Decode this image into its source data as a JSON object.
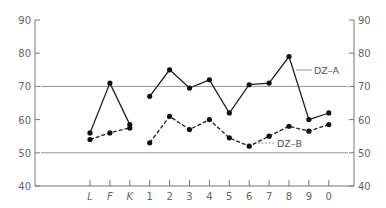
{
  "chart_data": {
    "type": "line",
    "title": "",
    "xlabel": "",
    "ylabel": "",
    "ylim": [
      40,
      90
    ],
    "yticks": [
      40,
      50,
      60,
      70,
      80,
      90
    ],
    "dual_y_axis": true,
    "grid": false,
    "categories": [
      "L",
      "F",
      "K",
      "1",
      "2",
      "3",
      "4",
      "5",
      "6",
      "7",
      "8",
      "9",
      "0"
    ],
    "reference_lines": [
      70,
      50
    ],
    "series": [
      {
        "name": "DZ-A",
        "style": "solid",
        "segments": [
          [
            0,
            2
          ],
          [
            3,
            12
          ]
        ],
        "values": [
          56,
          71,
          58.5,
          67,
          75,
          69.5,
          72,
          62,
          70.5,
          71,
          79,
          60,
          62
        ]
      },
      {
        "name": "DZ-B",
        "style": "dashed",
        "segments": [
          [
            0,
            2
          ],
          [
            3,
            12
          ]
        ],
        "values": [
          54,
          56,
          57.5,
          53,
          61,
          57,
          60,
          54.5,
          52,
          55,
          58,
          56.5,
          58.5
        ]
      }
    ],
    "annotations": [
      {
        "text": "DZ-A",
        "points_to_category": "8",
        "series": "DZ-A"
      },
      {
        "text": "DZ-B",
        "points_to_category": "6",
        "series": "DZ-B"
      }
    ],
    "legend": "inline annotations"
  },
  "labels": {
    "series_a": "DZ–A",
    "series_b": "DZ–B"
  }
}
